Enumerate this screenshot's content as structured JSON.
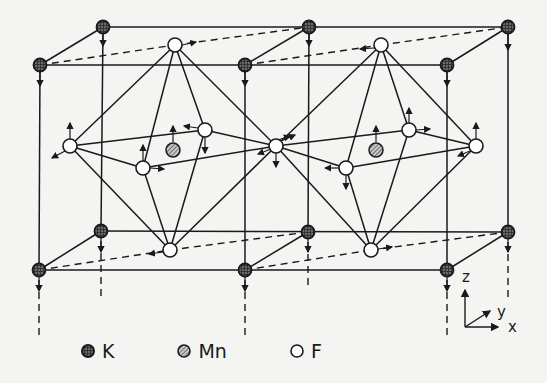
{
  "figure": {
    "type": "crystal-structure",
    "compound": "KMnF3 (perovskite)",
    "colors": {
      "line": "#1a1a1a",
      "background": "#f4f4f2",
      "K_fill": "#5a5a5a",
      "Mn_fill": "#9a9a9a",
      "F_fill": "#ffffff"
    }
  },
  "legend": [
    {
      "symbol": "K",
      "label": "K"
    },
    {
      "symbol": "Mn",
      "label": "Mn"
    },
    {
      "symbol": "F",
      "label": "F"
    }
  ],
  "axes": {
    "z": "z",
    "y": "y",
    "x": "x"
  },
  "atoms": {
    "K": [
      [
        103,
        27
      ],
      [
        309,
        27
      ],
      [
        508,
        27
      ],
      [
        40,
        65
      ],
      [
        245,
        65
      ],
      [
        447,
        65
      ],
      [
        101,
        231
      ],
      [
        308,
        232
      ],
      [
        508,
        232
      ],
      [
        39,
        270
      ],
      [
        245,
        270
      ],
      [
        447,
        270
      ]
    ],
    "Mn": [
      [
        173,
        150
      ],
      [
        376,
        150
      ]
    ],
    "F": [
      [
        175,
        45
      ],
      [
        381,
        45
      ],
      [
        170,
        250
      ],
      [
        371,
        250
      ],
      [
        70,
        146
      ],
      [
        205,
        130
      ],
      [
        143,
        168
      ],
      [
        276,
        146
      ],
      [
        409,
        130
      ],
      [
        346,
        168
      ],
      [
        476,
        146
      ]
    ]
  }
}
